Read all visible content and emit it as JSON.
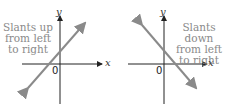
{
  "graphs": [
    {
      "description": "Slants up",
      "label_lines": [
        "Slants up",
        "from left",
        "to right"
      ],
      "x_axis": "x",
      "y_axis": "y",
      "origin": "0"
    },
    {
      "description": "Slants down",
      "label_lines": [
        "Slants down",
        "from left",
        "to right"
      ],
      "x_axis": "x",
      "y_axis": "y",
      "origin": "0"
    }
  ],
  "colors": {
    "line": "#8a8a8a",
    "axis": "#222222",
    "text": "#8a8a8a"
  }
}
